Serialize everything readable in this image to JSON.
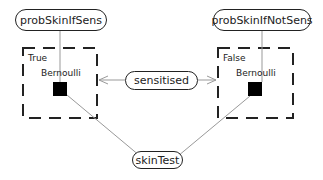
{
  "nodes": {
    "probSkinIfSens": "probSkinIfSens",
    "probSkinIfNotSens": "probSkinIfNotSens",
    "sensitised": "sensitised",
    "skinTest": "skinTest"
  },
  "gates": [
    {
      "case_label": "True",
      "factor_label": "Bernoulli"
    },
    {
      "case_label": "False",
      "factor_label": "Bernoulli"
    }
  ],
  "colors": {
    "edge": "#999999",
    "border": "#222222",
    "factor": "#000000"
  }
}
